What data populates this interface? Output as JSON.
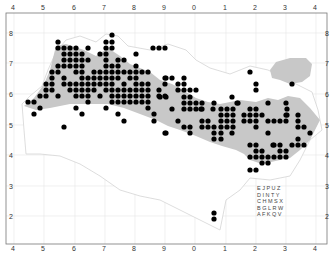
{
  "map": {
    "frame": {
      "x": 6,
      "y": 13,
      "width": 321,
      "height": 231
    },
    "colors": {
      "dot": "#000000",
      "range": "#c8c8c8",
      "grid": "#e2e2e2",
      "coast": "#d6d6d6",
      "frame": "#777777"
    },
    "top_labels": [
      {
        "t": "4",
        "x": 13
      },
      {
        "t": "5",
        "x": 43
      },
      {
        "t": "6",
        "x": 74
      },
      {
        "t": "7",
        "x": 104
      },
      {
        "t": "8",
        "x": 134
      },
      {
        "t": "9",
        "x": 164
      },
      {
        "t": "0",
        "x": 194
      },
      {
        "t": "1",
        "x": 225
      },
      {
        "t": "2",
        "x": 255
      },
      {
        "t": "3",
        "x": 285
      },
      {
        "t": "4",
        "x": 315
      }
    ],
    "bottom_labels": [
      {
        "t": "4",
        "x": 13
      },
      {
        "t": "5",
        "x": 43
      },
      {
        "t": "6",
        "x": 74
      },
      {
        "t": "7",
        "x": 104
      },
      {
        "t": "8",
        "x": 134
      },
      {
        "t": "9",
        "x": 164
      },
      {
        "t": "0",
        "x": 194
      },
      {
        "t": "1",
        "x": 225
      },
      {
        "t": "2",
        "x": 255
      },
      {
        "t": "3",
        "x": 285
      },
      {
        "t": "4",
        "x": 315
      }
    ],
    "left_labels": [
      {
        "t": "8",
        "y": 33
      },
      {
        "t": "7",
        "y": 63
      },
      {
        "t": "6",
        "y": 94
      },
      {
        "t": "5",
        "y": 125
      },
      {
        "t": "4",
        "y": 155
      },
      {
        "t": "3",
        "y": 186
      },
      {
        "t": "2",
        "y": 216
      }
    ],
    "right_labels": [
      {
        "t": "8",
        "y": 33
      },
      {
        "t": "7",
        "y": 63
      },
      {
        "t": "6",
        "y": 94
      },
      {
        "t": "5",
        "y": 125
      },
      {
        "t": "4",
        "y": 155
      },
      {
        "t": "3",
        "y": 186
      },
      {
        "t": "2",
        "y": 216
      }
    ],
    "key_grid": {
      "x": 257,
      "y": 190,
      "rows": [
        "E J P U Z",
        "D I N T Y",
        "C H M S X",
        "B G L R W",
        "A F K Q V"
      ]
    },
    "dots": [
      [
        112,
        35
      ],
      [
        58,
        42
      ],
      [
        106,
        42
      ],
      [
        112,
        42
      ],
      [
        58,
        48
      ],
      [
        64,
        48
      ],
      [
        70,
        48
      ],
      [
        76,
        48
      ],
      [
        88,
        48
      ],
      [
        106,
        48
      ],
      [
        112,
        48
      ],
      [
        153,
        48
      ],
      [
        159,
        48
      ],
      [
        165,
        48
      ],
      [
        64,
        54
      ],
      [
        70,
        54
      ],
      [
        76,
        54
      ],
      [
        82,
        54
      ],
      [
        100,
        54
      ],
      [
        106,
        54
      ],
      [
        136,
        54
      ],
      [
        64,
        60
      ],
      [
        70,
        60
      ],
      [
        76,
        60
      ],
      [
        82,
        60
      ],
      [
        88,
        60
      ],
      [
        106,
        60
      ],
      [
        118,
        60
      ],
      [
        124,
        60
      ],
      [
        58,
        66
      ],
      [
        64,
        66
      ],
      [
        70,
        66
      ],
      [
        76,
        66
      ],
      [
        82,
        66
      ],
      [
        106,
        66
      ],
      [
        112,
        66
      ],
      [
        118,
        66
      ],
      [
        136,
        66
      ],
      [
        52,
        72
      ],
      [
        58,
        72
      ],
      [
        76,
        72
      ],
      [
        82,
        72
      ],
      [
        94,
        72
      ],
      [
        100,
        72
      ],
      [
        106,
        72
      ],
      [
        112,
        72
      ],
      [
        118,
        72
      ],
      [
        124,
        72
      ],
      [
        130,
        72
      ],
      [
        136,
        72
      ],
      [
        142,
        72
      ],
      [
        148,
        72
      ],
      [
        250,
        72
      ],
      [
        52,
        78
      ],
      [
        64,
        78
      ],
      [
        82,
        78
      ],
      [
        88,
        78
      ],
      [
        94,
        78
      ],
      [
        100,
        78
      ],
      [
        106,
        78
      ],
      [
        112,
        78
      ],
      [
        118,
        78
      ],
      [
        130,
        78
      ],
      [
        136,
        78
      ],
      [
        165,
        78
      ],
      [
        166,
        78
      ],
      [
        172,
        78
      ],
      [
        184,
        78
      ],
      [
        46,
        84
      ],
      [
        52,
        84
      ],
      [
        64,
        84
      ],
      [
        70,
        84
      ],
      [
        76,
        84
      ],
      [
        82,
        84
      ],
      [
        88,
        84
      ],
      [
        94,
        84
      ],
      [
        100,
        84
      ],
      [
        106,
        84
      ],
      [
        112,
        84
      ],
      [
        124,
        84
      ],
      [
        136,
        84
      ],
      [
        142,
        84
      ],
      [
        148,
        84
      ],
      [
        165,
        84
      ],
      [
        178,
        84
      ],
      [
        184,
        84
      ],
      [
        256,
        84
      ],
      [
        292,
        84
      ],
      [
        46,
        90
      ],
      [
        52,
        90
      ],
      [
        70,
        90
      ],
      [
        76,
        90
      ],
      [
        82,
        90
      ],
      [
        88,
        90
      ],
      [
        94,
        90
      ],
      [
        106,
        90
      ],
      [
        112,
        90
      ],
      [
        118,
        90
      ],
      [
        124,
        90
      ],
      [
        130,
        90
      ],
      [
        136,
        90
      ],
      [
        142,
        90
      ],
      [
        148,
        90
      ],
      [
        159,
        90
      ],
      [
        178,
        90
      ],
      [
        184,
        90
      ],
      [
        190,
        90
      ],
      [
        196,
        90
      ],
      [
        256,
        90
      ],
      [
        40,
        96
      ],
      [
        46,
        96
      ],
      [
        58,
        96
      ],
      [
        76,
        96
      ],
      [
        82,
        96
      ],
      [
        88,
        96
      ],
      [
        100,
        96
      ],
      [
        112,
        96
      ],
      [
        118,
        96
      ],
      [
        124,
        96
      ],
      [
        130,
        96
      ],
      [
        136,
        96
      ],
      [
        142,
        96
      ],
      [
        148,
        96
      ],
      [
        159,
        96
      ],
      [
        165,
        96
      ],
      [
        160,
        97
      ],
      [
        166,
        97
      ],
      [
        184,
        97
      ],
      [
        190,
        97
      ],
      [
        232,
        97
      ],
      [
        28,
        102
      ],
      [
        34,
        102
      ],
      [
        88,
        102
      ],
      [
        112,
        102
      ],
      [
        118,
        102
      ],
      [
        124,
        102
      ],
      [
        130,
        102
      ],
      [
        136,
        102
      ],
      [
        142,
        102
      ],
      [
        148,
        102
      ],
      [
        184,
        103
      ],
      [
        190,
        103
      ],
      [
        196,
        103
      ],
      [
        202,
        103
      ],
      [
        214,
        103
      ],
      [
        237,
        103
      ],
      [
        238,
        103
      ],
      [
        268,
        103
      ],
      [
        286,
        103
      ],
      [
        40,
        108
      ],
      [
        76,
        108
      ],
      [
        106,
        108
      ],
      [
        148,
        108
      ],
      [
        172,
        109
      ],
      [
        184,
        109
      ],
      [
        190,
        109
      ],
      [
        196,
        109
      ],
      [
        202,
        109
      ],
      [
        201,
        109
      ],
      [
        213,
        109
      ],
      [
        221,
        109
      ],
      [
        227,
        109
      ],
      [
        233,
        109
      ],
      [
        250,
        109
      ],
      [
        256,
        109
      ],
      [
        287,
        109
      ],
      [
        34,
        114
      ],
      [
        82,
        114
      ],
      [
        118,
        114
      ],
      [
        154,
        114
      ],
      [
        221,
        115
      ],
      [
        227,
        115
      ],
      [
        233,
        115
      ],
      [
        244,
        115
      ],
      [
        250,
        115
      ],
      [
        256,
        115
      ],
      [
        262,
        115
      ],
      [
        286,
        115
      ],
      [
        287,
        115
      ],
      [
        298,
        115
      ],
      [
        124,
        121
      ],
      [
        154,
        121
      ],
      [
        178,
        121
      ],
      [
        202,
        121
      ],
      [
        208,
        121
      ],
      [
        221,
        121
      ],
      [
        227,
        121
      ],
      [
        233,
        121
      ],
      [
        244,
        121
      ],
      [
        250,
        121
      ],
      [
        256,
        121
      ],
      [
        268,
        121
      ],
      [
        274,
        121
      ],
      [
        280,
        121
      ],
      [
        286,
        121
      ],
      [
        298,
        121
      ],
      [
        64,
        127
      ],
      [
        184,
        127
      ],
      [
        190,
        127
      ],
      [
        202,
        127
      ],
      [
        208,
        127
      ],
      [
        214,
        127
      ],
      [
        221,
        127
      ],
      [
        227,
        127
      ],
      [
        233,
        127
      ],
      [
        256,
        127
      ],
      [
        298,
        127
      ],
      [
        304,
        127
      ],
      [
        165,
        133
      ],
      [
        166,
        133
      ],
      [
        190,
        133
      ],
      [
        214,
        133
      ],
      [
        221,
        133
      ],
      [
        232,
        133
      ],
      [
        268,
        133
      ],
      [
        310,
        133
      ],
      [
        214,
        139
      ],
      [
        221,
        139
      ],
      [
        298,
        139
      ],
      [
        250,
        145
      ],
      [
        256,
        145
      ],
      [
        273,
        145
      ],
      [
        274,
        145
      ],
      [
        280,
        145
      ],
      [
        292,
        145
      ],
      [
        298,
        145
      ],
      [
        304,
        145
      ],
      [
        280,
        151
      ],
      [
        286,
        151
      ],
      [
        256,
        151
      ],
      [
        262,
        151
      ],
      [
        250,
        157
      ],
      [
        256,
        157
      ],
      [
        262,
        157
      ],
      [
        268,
        157
      ],
      [
        274,
        157
      ],
      [
        280,
        157
      ],
      [
        286,
        157
      ],
      [
        262,
        163
      ],
      [
        268,
        163
      ],
      [
        250,
        170
      ],
      [
        256,
        170
      ],
      [
        214,
        213
      ],
      [
        214,
        219
      ]
    ]
  }
}
